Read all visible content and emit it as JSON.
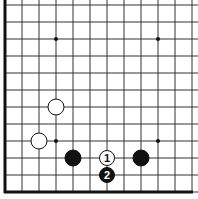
{
  "board": {
    "grid_spacing": 17,
    "origin_x": 5,
    "origin_y": 192,
    "columns": 12,
    "rows": 12,
    "line_color": "#333333",
    "edge_left": true,
    "edge_bottom": true
  },
  "star_points": [
    {
      "col": 3,
      "row": 9
    },
    {
      "col": 9,
      "row": 9
    },
    {
      "col": 3,
      "row": 3
    },
    {
      "col": 9,
      "row": 3
    }
  ],
  "stones": [
    {
      "color": "white",
      "col": 3,
      "row": 5,
      "label": ""
    },
    {
      "color": "white",
      "col": 2,
      "row": 3,
      "label": ""
    },
    {
      "color": "black",
      "col": 4,
      "row": 2,
      "label": ""
    },
    {
      "color": "black",
      "col": 8,
      "row": 2,
      "label": ""
    },
    {
      "color": "white",
      "col": 6,
      "row": 2,
      "label": "1"
    },
    {
      "color": "black",
      "col": 6,
      "row": 1,
      "label": "2"
    }
  ]
}
